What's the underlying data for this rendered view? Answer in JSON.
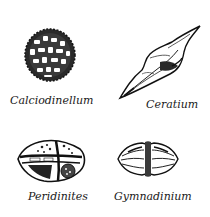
{
  "figures": [
    {
      "name": "Calciodinellum",
      "label": "Calciodinellum",
      "shape": "spherical-cyst"
    },
    {
      "name": "Ceratium",
      "label": "Ceratium",
      "shape": "horned-elongate"
    },
    {
      "name": "Peridinites",
      "label": "Peridinites",
      "shape": "plated-cyst"
    },
    {
      "name": "Gymnadinium",
      "label": "Gymnadinium",
      "shape": "biconical-girdled"
    }
  ],
  "colors": {
    "ink": "#1a1a1a",
    "background": "#ffffff"
  }
}
